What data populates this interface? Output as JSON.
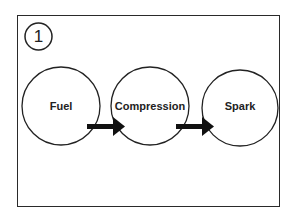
{
  "step": {
    "number": "1"
  },
  "nodes": [
    {
      "label": "Fuel"
    },
    {
      "label": "Compression"
    },
    {
      "label": "Spark"
    }
  ],
  "colors": {
    "stroke": "#222222",
    "background": "#ffffff"
  }
}
